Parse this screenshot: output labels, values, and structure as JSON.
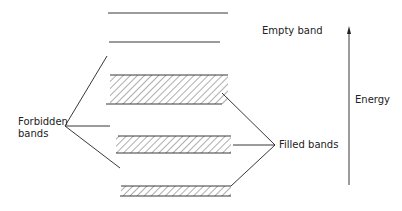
{
  "labels": {
    "empty_band": "Empty band",
    "energy": "Energy",
    "forbidden_line1": "Forbidden",
    "forbidden_line2": "bands",
    "filled_bands": "Filled bands"
  },
  "colors": {
    "ink": "#222222",
    "background": "#ffffff"
  }
}
